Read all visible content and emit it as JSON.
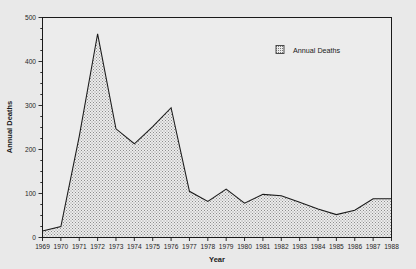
{
  "chart_data": {
    "type": "area",
    "title": "",
    "xlabel": "Year",
    "ylabel": "Annual Deaths",
    "categories": [
      "1969",
      "1970",
      "1971",
      "1972",
      "1973",
      "1974",
      "1975",
      "1976",
      "1977",
      "1978",
      "1979",
      "1980",
      "1981",
      "1982",
      "1983",
      "1984",
      "1985",
      "1986",
      "1987",
      "1988"
    ],
    "values": [
      15,
      25,
      230,
      463,
      247,
      213,
      252,
      295,
      105,
      82,
      110,
      78,
      98,
      95,
      80,
      65,
      52,
      62,
      88,
      88
    ],
    "series": [
      {
        "name": "Annual Deaths",
        "values": [
          15,
          25,
          230,
          463,
          247,
          213,
          252,
          295,
          105,
          82,
          110,
          78,
          98,
          95,
          80,
          65,
          52,
          62,
          88,
          88
        ]
      }
    ],
    "ylim": [
      0,
      500
    ],
    "ytick_labels": [
      "0",
      "100",
      "200",
      "300",
      "400",
      "500"
    ],
    "ytick_values": [
      0,
      100,
      200,
      300,
      400,
      500
    ],
    "yminor_step": 25,
    "xlim": [
      "1969",
      "1988"
    ],
    "grid": false,
    "legend_position": "top-right",
    "legend_entries": [
      "Annual Deaths"
    ],
    "fill_style": "stipple",
    "colors": {
      "background": "#e9e9e9",
      "plot_background": "#ececec",
      "line": "#1a1a1a",
      "fill": "#d6d6d6",
      "axis": "#1a1a1a",
      "text": "#1a1a1a"
    }
  },
  "legend": {
    "swatch_name": "stipple-square-swatch",
    "label": "Annual Deaths"
  },
  "axes": {
    "y_title": "Annual Deaths",
    "x_title": "Year"
  }
}
